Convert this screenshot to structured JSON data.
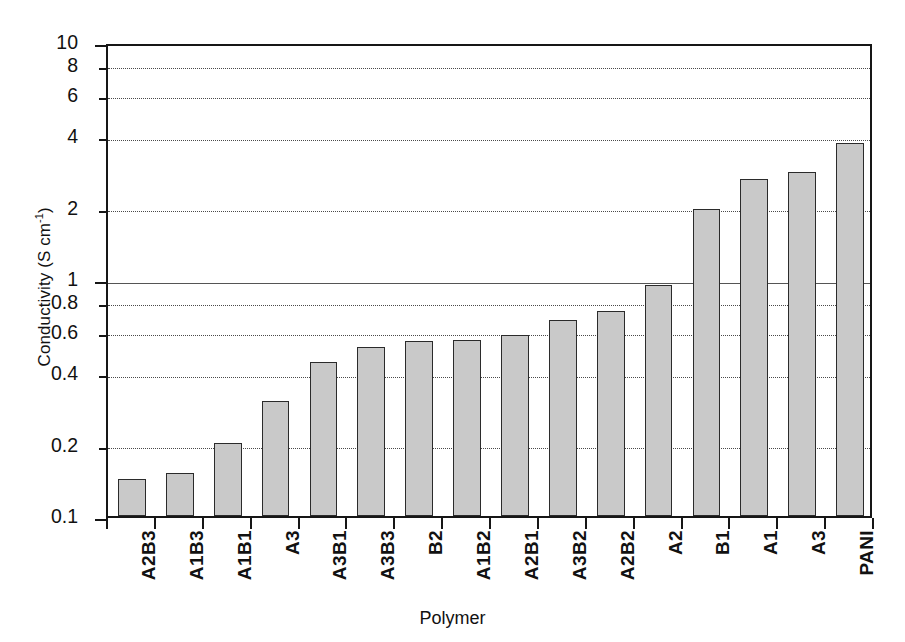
{
  "chart_data": {
    "type": "bar",
    "title": "",
    "xlabel": "Polymer",
    "ylabel": "Conductivity (S cm-1)",
    "ylabel_base": "Conductivity (S cm",
    "ylabel_exponent": "-1",
    "ylabel_suffix": ")",
    "yscale": "log",
    "ylim": [
      0.1,
      10
    ],
    "ytick_labels": [
      "10",
      "8",
      "6",
      "4",
      "2",
      "1",
      "0.8",
      "0.6",
      "0.4",
      "0.2",
      "0.1"
    ],
    "ytick_values": [
      10,
      8,
      6,
      4,
      2,
      1,
      0.8,
      0.6,
      0.4,
      0.2,
      0.1
    ],
    "grid": "horizontal-dotted",
    "gridline_solid_at": 1,
    "legend": "none",
    "bar_fill_color": "#c9c9c9",
    "bar_edge_color": "#2b2b2b",
    "axis_color": "#161616",
    "categories": [
      "A2B3",
      "A1B3",
      "A1B1",
      "A3",
      "A3B1",
      "A3B3",
      "B2",
      "A1B2",
      "A2B1",
      "A3B2",
      "A2B2",
      "A2",
      "B1",
      "A1",
      "A3",
      "PANI"
    ],
    "values": [
      0.143,
      0.152,
      0.203,
      0.305,
      0.445,
      0.515,
      0.545,
      0.555,
      0.58,
      0.67,
      0.73,
      0.94,
      1.98,
      2.65,
      2.82,
      3.75
    ]
  }
}
